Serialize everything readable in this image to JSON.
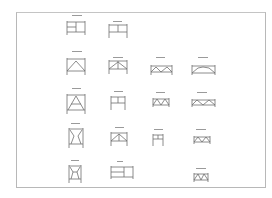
{
  "document": {
    "type": "technical drawing sheet",
    "description": "Elevation drawings of scaffold / frame types arranged in a grid",
    "border_color": "#b8b8b8",
    "line_color": "#6e6e6e"
  },
  "frames": [
    {
      "id": "r1c1",
      "style": "box-split-right",
      "caption": ""
    },
    {
      "id": "r1c2",
      "style": "box-midrail",
      "caption": ""
    },
    {
      "id": "r2c1",
      "style": "box-chevron",
      "caption": ""
    },
    {
      "id": "r2c2",
      "style": "box-chevron-low",
      "caption": ""
    },
    {
      "id": "r2c3",
      "style": "wide-chevron",
      "caption": ""
    },
    {
      "id": "r2c4",
      "style": "wide-arch",
      "caption": ""
    },
    {
      "id": "r3c1",
      "style": "tall-a-frame",
      "caption": ""
    },
    {
      "id": "r3c2",
      "style": "box-midrail-posts",
      "caption": ""
    },
    {
      "id": "r3c3",
      "style": "wide-x",
      "caption": ""
    },
    {
      "id": "r3c4",
      "style": "wide-x-long",
      "caption": ""
    },
    {
      "id": "r4c1",
      "style": "tall-tapered",
      "caption": ""
    },
    {
      "id": "r4c2",
      "style": "box-chevron-inner",
      "caption": ""
    },
    {
      "id": "r4c3",
      "style": "small-midrail",
      "caption": ""
    },
    {
      "id": "r4c4",
      "style": "wide-x-small",
      "caption": ""
    },
    {
      "id": "r5c1",
      "style": "tall-tapered-2",
      "caption": ""
    },
    {
      "id": "r5c2",
      "style": "wide-split",
      "caption": ""
    },
    {
      "id": "r5c4",
      "style": "small-x",
      "caption": ""
    }
  ]
}
